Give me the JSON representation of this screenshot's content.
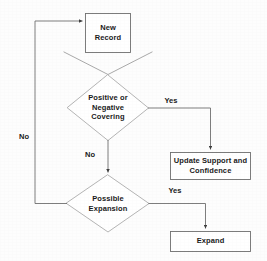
{
  "diagram": {
    "stroke_color": "#4a4a4a",
    "text_color": "#1a1a1a",
    "background_color": "#fdfdfd",
    "nodes": [
      {
        "id": "new-record",
        "shape": "process",
        "label": "New\nRecord",
        "line1": "New",
        "line2": "Record"
      },
      {
        "id": "covering-decision",
        "shape": "decision",
        "label": "Positive or\nNegative\nCovering",
        "line1": "Positive or",
        "line2": "Negative",
        "line3": "Covering"
      },
      {
        "id": "update-support",
        "shape": "process",
        "label": "Update Support and\nConfidence",
        "line1": "Update Support and",
        "line2": "Confidence"
      },
      {
        "id": "expansion-decision",
        "shape": "decision",
        "label": "Possible\nExpansion",
        "line1": "Possible",
        "line2": "Expansion"
      },
      {
        "id": "expand",
        "shape": "process",
        "label": "Expand",
        "line1": "Expand"
      }
    ],
    "edge_labels": [
      {
        "id": "covering-yes",
        "text": "Yes"
      },
      {
        "id": "covering-no",
        "text": "No"
      },
      {
        "id": "expansion-yes",
        "text": "Yes"
      },
      {
        "id": "loop-no",
        "text": "No"
      }
    ]
  }
}
